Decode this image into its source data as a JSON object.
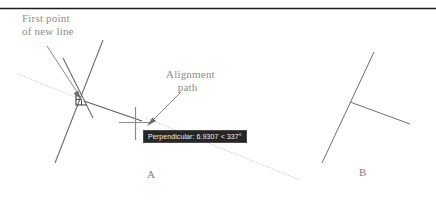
{
  "page": {
    "background_color": "#ffffff",
    "width": 436,
    "height": 204
  },
  "rule": {
    "name": "top-horizontal-rule",
    "color": "#1c1c1c"
  },
  "callouts": [
    {
      "id": "first-point",
      "text": "First point\nof new line",
      "color": "#8d8d8d"
    },
    {
      "id": "alignment-path",
      "text": "Alignment\n    path",
      "color": "#8d8d8d"
    }
  ],
  "tooltip": {
    "text": "Perpendicular: 6.9307 < 337°",
    "background_color": "#262626",
    "text_color": "#f0f0f0",
    "snap_mode": "Perpendicular",
    "distance": "6.9307",
    "angle": "337°"
  },
  "figure_labels": [
    {
      "id": "a",
      "text": "A"
    },
    {
      "id": "b",
      "text": "B"
    }
  ],
  "graphics": {
    "geometry_line_color": "#6e6e6e",
    "alignment_path_color": "#c9c9c9",
    "leader_color": "#767676",
    "crosshair_color": "#8a8a8a",
    "snap_marker_color": "#3a3a3a",
    "rubberband_color": "#5d5d5d"
  },
  "icons": {
    "perpendicular_snap_marker": "perpendicular-snap-marker-icon",
    "crosshair_cursor": "crosshair-cursor-icon"
  }
}
